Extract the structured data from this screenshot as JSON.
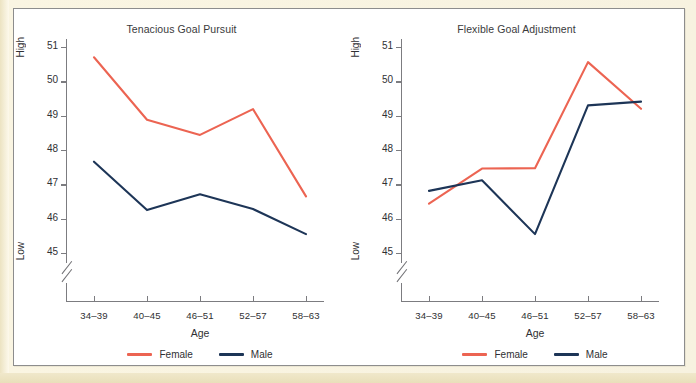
{
  "figure": {
    "axis_high_label": "High",
    "axis_low_label": "Low",
    "x_axis_title": "Age",
    "female_color": "#ec6452",
    "male_color": "#1d3557",
    "axis_color": "#7c7c80",
    "page_border_color": "#f3ecd2"
  },
  "chart_data": [
    {
      "type": "line",
      "title": "Tenacious Goal Pursuit",
      "xlabel": "Age",
      "ylabel": "",
      "categories": [
        "34–39",
        "40–45",
        "46–51",
        "52–57",
        "58–63"
      ],
      "yticks": [
        45,
        46,
        47,
        48,
        49,
        50,
        51
      ],
      "ytick_labels": [
        "45",
        "46",
        "47",
        "48",
        "49",
        "50",
        "51"
      ],
      "ylim": [
        45,
        51
      ],
      "y_axis_break": true,
      "y_high_label": "High",
      "y_low_label": "Low",
      "grid": false,
      "legend_position": "bottom",
      "series": [
        {
          "name": "Female",
          "color": "#ec6452",
          "values": [
            50.7,
            48.88,
            48.44,
            49.19,
            46.65
          ]
        },
        {
          "name": "Male",
          "color": "#1d3557",
          "values": [
            47.66,
            46.25,
            46.71,
            46.28,
            45.55
          ]
        }
      ]
    },
    {
      "type": "line",
      "title": "Flexible Goal Adjustment",
      "xlabel": "Age",
      "ylabel": "",
      "categories": [
        "34–39",
        "40–45",
        "46–51",
        "52–57",
        "58–63"
      ],
      "yticks": [
        45,
        46,
        47,
        48,
        49,
        50,
        51
      ],
      "ytick_labels": [
        "45",
        "46",
        "47",
        "48",
        "49",
        "50",
        "51"
      ],
      "ylim": [
        45,
        51
      ],
      "y_axis_break": true,
      "y_high_label": "High",
      "y_low_label": "Low",
      "grid": false,
      "legend_position": "bottom",
      "series": [
        {
          "name": "Female",
          "color": "#ec6452",
          "values": [
            46.44,
            47.46,
            47.47,
            50.56,
            49.2
          ]
        },
        {
          "name": "Male",
          "color": "#1d3557",
          "values": [
            46.81,
            47.12,
            45.55,
            49.3,
            49.41
          ]
        }
      ]
    }
  ]
}
